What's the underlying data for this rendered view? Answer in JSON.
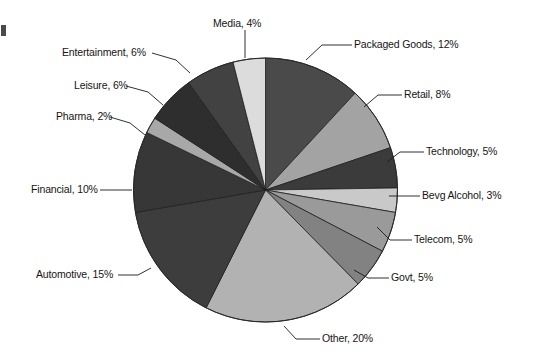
{
  "chart_data": {
    "type": "pie",
    "title": "",
    "subtitle": "",
    "xlabel": "",
    "ylabel": "",
    "legend_position": "callout-labels",
    "grid": false,
    "units": "%",
    "start_angle_deg": -90,
    "direction": "clockwise",
    "categories": [
      "Packaged Goods",
      "Retail",
      "Technology",
      "Bevg Alcohol",
      "Telecom",
      "Govt",
      "Other",
      "Automotive",
      "Financial",
      "Pharma",
      "Leisure",
      "Entertainment",
      "Media"
    ],
    "values": [
      12,
      8,
      5,
      3,
      5,
      5,
      20,
      15,
      10,
      2,
      6,
      6,
      4
    ],
    "colors": [
      "#4a4a4a",
      "#a3a3a3",
      "#3b3b3b",
      "#c9c9c9",
      "#9a9a9a",
      "#828282",
      "#b2b2b2",
      "#3d3d3d",
      "#373737",
      "#a8a8a8",
      "#2e2e2e",
      "#424242",
      "#dcdcdc"
    ],
    "slices": [
      {
        "label": "Packaged Goods, 12%",
        "name": "Packaged Goods",
        "value": 12,
        "color": "#4a4a4a"
      },
      {
        "label": "Retail, 8%",
        "name": "Retail",
        "value": 8,
        "color": "#a3a3a3"
      },
      {
        "label": "Technology, 5%",
        "name": "Technology",
        "value": 5,
        "color": "#3b3b3b"
      },
      {
        "label": "Bevg Alcohol, 3%",
        "name": "Bevg Alcohol",
        "value": 3,
        "color": "#c9c9c9"
      },
      {
        "label": "Telecom, 5%",
        "name": "Telecom",
        "value": 5,
        "color": "#9a9a9a"
      },
      {
        "label": "Govt, 5%",
        "name": "Govt",
        "value": 5,
        "color": "#828282"
      },
      {
        "label": "Other, 20%",
        "name": "Other",
        "value": 20,
        "color": "#b2b2b2"
      },
      {
        "label": "Automotive, 15%",
        "name": "Automotive",
        "value": 15,
        "color": "#3d3d3d"
      },
      {
        "label": "Financial, 10%",
        "name": "Financial",
        "value": 10,
        "color": "#373737"
      },
      {
        "label": "Pharma, 2%",
        "name": "Pharma",
        "value": 2,
        "color": "#a8a8a8"
      },
      {
        "label": "Leisure, 6%",
        "name": "Leisure",
        "value": 6,
        "color": "#2e2e2e"
      },
      {
        "label": "Entertainment, 6%",
        "name": "Entertainment",
        "value": 6,
        "color": "#424242"
      },
      {
        "label": "Media, 4%",
        "name": "Media",
        "value": 4,
        "color": "#dcdcdc"
      }
    ],
    "total": 100
  },
  "labels": {
    "packaged_goods": "Packaged Goods, 12%",
    "retail": "Retail, 8%",
    "technology": "Technology, 5%",
    "bevg_alcohol": "Bevg Alcohol, 3%",
    "telecom": "Telecom, 5%",
    "govt": "Govt, 5%",
    "other": "Other, 20%",
    "automotive": "Automotive, 15%",
    "financial": "Financial, 10%",
    "pharma": "Pharma, 2%",
    "leisure": "Leisure, 6%",
    "entertainment": "Entertainment, 6%",
    "media": "Media, 4%"
  }
}
